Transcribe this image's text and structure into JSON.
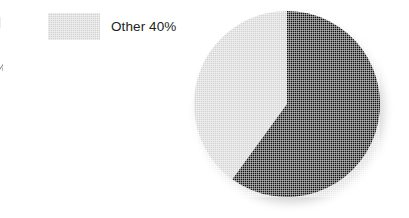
{
  "figure": {
    "background_color": "#ffffff",
    "width": 409,
    "height": 218
  },
  "legend": {
    "position": "left",
    "entries": [
      {
        "label": "Other 40%",
        "series_name": "Other",
        "value_percent": 40,
        "swatch_color": "#d2d2d2",
        "swatch_texture": "crosshatch-halftone"
      }
    ],
    "cropped_fragments": [
      {
        "name": "legend-fragment-swatch",
        "description": "corner of an off-frame legend swatch",
        "text": ""
      },
      {
        "name": "legend-fragment-percent",
        "description": "tail of a percent sign from an off-frame legend row",
        "text": "%"
      }
    ]
  },
  "pie": {
    "center_x": 287,
    "center_y": 104,
    "radius": 93,
    "start_angle_deg": 0,
    "direction": "clockwise"
  },
  "chart_data": {
    "type": "pie",
    "title": "",
    "categories": [
      "Main",
      "Other"
    ],
    "values": [
      60,
      40
    ],
    "labels": [
      "",
      "Other 40%"
    ],
    "colors": [
      "#111111",
      "#d2d2d2"
    ],
    "units": "percent",
    "legend_position": "left",
    "grid": false,
    "slices": [
      {
        "name": "Main",
        "value": 60,
        "color": "#111111",
        "start_angle_deg": 0,
        "end_angle_deg": 216,
        "labeled": false,
        "label": ""
      },
      {
        "name": "Other",
        "value": 40,
        "color": "#d2d2d2",
        "start_angle_deg": 216,
        "end_angle_deg": 360,
        "labeled": true,
        "label": "Other 40%"
      }
    ]
  }
}
